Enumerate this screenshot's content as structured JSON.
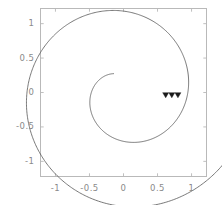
{
  "chart_data": {
    "type": "line",
    "title": "",
    "xlabel": "",
    "ylabel": "",
    "xlim": [
      -1.22,
      1.22
    ],
    "ylim": [
      -1.22,
      1.22
    ],
    "grid": false,
    "legend": null,
    "curve": {
      "name": "archimedean-spiral",
      "equation": "r = a*theta",
      "theta_start_deg": 118,
      "theta_end_deg": 2280,
      "turns": 6,
      "r_start": 0.31,
      "r_end": 1.15,
      "color": "#555555",
      "line_width": 0.8
    },
    "markers": {
      "name": "direction-arrowheads",
      "shape": "triangle-down",
      "count": 3,
      "color": "#1a1a1a",
      "points": [
        {
          "x": 0.62,
          "y": -0.04
        },
        {
          "x": 0.71,
          "y": -0.04
        },
        {
          "x": 0.8,
          "y": -0.04
        }
      ]
    },
    "xticks": [
      -1,
      -0.5,
      0,
      0.5,
      1
    ],
    "xticklabels": [
      "-1",
      "-0.5",
      "0",
      "0.5",
      "1"
    ],
    "yticks": [
      -1,
      -0.5,
      0,
      0.5,
      1
    ],
    "yticklabels": [
      "-1",
      "-0.5",
      "0",
      "0.5",
      "1"
    ]
  },
  "frame": {
    "border_color": "#b9b9b9",
    "background": "#ffffff",
    "tick_color": "#b9b9b9",
    "label_color": "#8a8a8a"
  }
}
